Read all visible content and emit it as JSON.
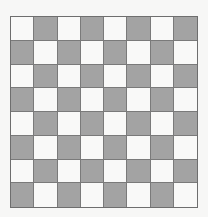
{
  "board": {
    "rows": 8,
    "cols": 8,
    "top_left_color": "light",
    "colors": {
      "light": "#f9f9f8",
      "dark": "#a3a3a3",
      "grid_line": "#7a7a7a"
    },
    "pieces": []
  }
}
